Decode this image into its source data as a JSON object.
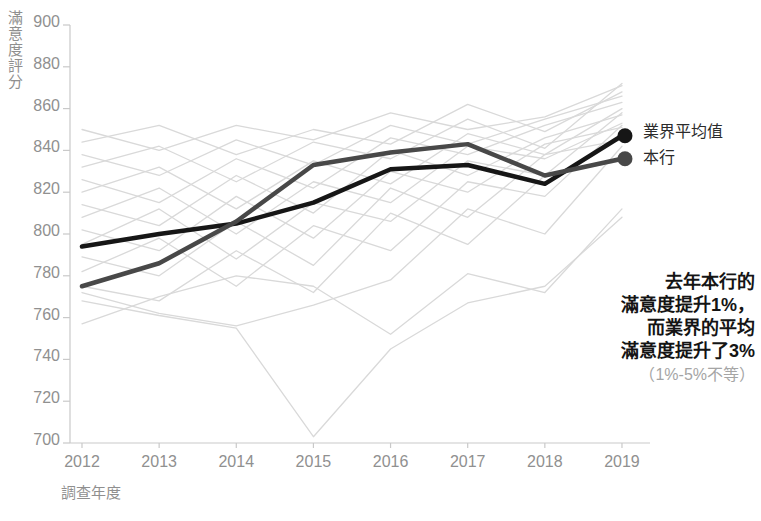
{
  "y_axis": {
    "title": "滿意度評分",
    "ticks": [
      900,
      880,
      860,
      840,
      820,
      800,
      780,
      760,
      740,
      720,
      700
    ]
  },
  "x_axis": {
    "title": "調查年度",
    "ticks": [
      "2012",
      "2013",
      "2014",
      "2015",
      "2016",
      "2017",
      "2018",
      "2019"
    ]
  },
  "legend": {
    "industry_avg": "業界平均值",
    "our_bank": "本行"
  },
  "annotation": {
    "lines": [
      "去年本行的",
      "滿意度提升1%，",
      "而業界的平均",
      "滿意度提升了3%"
    ],
    "note": "（1%-5%不等）"
  },
  "colors": {
    "industry_avg_line": "#161616",
    "our_bank_line": "#484848",
    "background_line": "#d9d9d9",
    "axis": "#c9c9c9",
    "tick_text": "#909090"
  },
  "chart_data": {
    "type": "line",
    "x": [
      2012,
      2013,
      2014,
      2015,
      2016,
      2017,
      2018,
      2019
    ],
    "xlabel": "調查年度",
    "ylabel": "滿意度評分",
    "ylim": [
      700,
      900
    ],
    "y_tick_step": 20,
    "grid": false,
    "legend_position": "right-of-line-ends",
    "series": [
      {
        "name": "業界平均值",
        "color": "#161616",
        "endpoint_dot": true,
        "values": [
          794,
          800,
          805,
          815,
          831,
          833,
          824,
          847
        ]
      },
      {
        "name": "本行",
        "color": "#484848",
        "endpoint_dot": true,
        "values": [
          775,
          786,
          806,
          833,
          839,
          843,
          828,
          836
        ]
      }
    ],
    "background_series": [
      {
        "values": [
          850,
          840,
          852,
          845,
          858,
          850,
          856,
          871
        ]
      },
      {
        "values": [
          844,
          852,
          838,
          850,
          843,
          862,
          849,
          868
        ]
      },
      {
        "values": [
          838,
          828,
          845,
          833,
          852,
          843,
          855,
          866
        ]
      },
      {
        "values": [
          832,
          842,
          825,
          844,
          836,
          855,
          841,
          872
        ]
      },
      {
        "values": [
          826,
          815,
          836,
          822,
          846,
          838,
          852,
          863
        ]
      },
      {
        "values": [
          820,
          832,
          812,
          835,
          824,
          848,
          838,
          860
        ]
      },
      {
        "values": [
          814,
          804,
          828,
          810,
          840,
          828,
          846,
          857
        ]
      },
      {
        "values": [
          808,
          822,
          800,
          825,
          815,
          842,
          836,
          853
        ]
      },
      {
        "values": [
          802,
          792,
          818,
          798,
          830,
          820,
          843,
          851
        ]
      },
      {
        "values": [
          795,
          812,
          788,
          815,
          806,
          835,
          828,
          858
        ]
      },
      {
        "values": [
          789,
          780,
          806,
          785,
          822,
          808,
          838,
          845
        ]
      },
      {
        "values": [
          782,
          798,
          775,
          804,
          792,
          825,
          818,
          852
        ]
      },
      {
        "values": [
          775,
          768,
          792,
          772,
          810,
          795,
          828,
          835
        ]
      },
      {
        "values": [
          772,
          762,
          756,
          766,
          778,
          812,
          800,
          842
        ]
      },
      {
        "values": [
          757,
          770,
          780,
          775,
          752,
          781,
          772,
          812
        ]
      },
      {
        "values": [
          768,
          761,
          755,
          703,
          745,
          767,
          775,
          808
        ]
      }
    ]
  }
}
